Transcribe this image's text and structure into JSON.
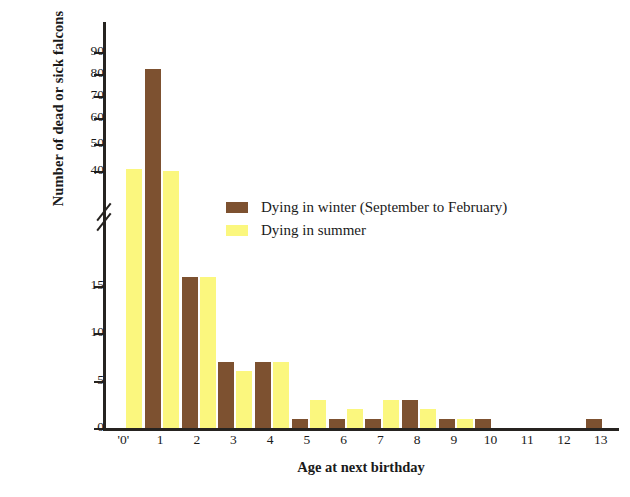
{
  "chart_data": {
    "type": "bar",
    "title": "",
    "xlabel": "Age at next birthday",
    "ylabel": "Number of dead or sick falcons",
    "categories": [
      "'0'",
      "1",
      "2",
      "3",
      "4",
      "5",
      "6",
      "7",
      "8",
      "9",
      "10",
      "11",
      "12",
      "13"
    ],
    "series": [
      {
        "name": "Dying in winter (September to February)",
        "color": "#7d5130",
        "values": [
          0,
          83,
          16,
          7,
          7,
          1,
          1,
          1,
          3,
          1,
          1,
          0,
          0,
          1
        ]
      },
      {
        "name": "Dying in summer",
        "color": "#fbf77e",
        "values": [
          41,
          40,
          16,
          6,
          7,
          3,
          2,
          3,
          2,
          1,
          0,
          0,
          0,
          0
        ]
      }
    ],
    "y_axis": {
      "broken": true,
      "lower_ticks": [
        0,
        5,
        10,
        15
      ],
      "upper_ticks": [
        40,
        50,
        60,
        70,
        80,
        90
      ],
      "ylim": [
        0,
        95
      ],
      "grid": false
    },
    "legend_position": "center"
  },
  "axis": {
    "y_title": "Number of dead or sick falcons",
    "x_title": "Age at next birthday",
    "y_ticks_upper": [
      "90",
      "80",
      "70",
      "60",
      "50",
      "40"
    ],
    "y_ticks_lower": [
      "15",
      "10",
      "5",
      "0"
    ],
    "x_ticks": [
      "'0'",
      "1",
      "2",
      "3",
      "4",
      "5",
      "6",
      "7",
      "8",
      "9",
      "10",
      "11",
      "12",
      "13"
    ]
  },
  "legend": {
    "items": [
      {
        "label": "Dying in winter (September to February)",
        "swatch": "winter"
      },
      {
        "label": "Dying in summer",
        "swatch": "summer"
      }
    ]
  }
}
